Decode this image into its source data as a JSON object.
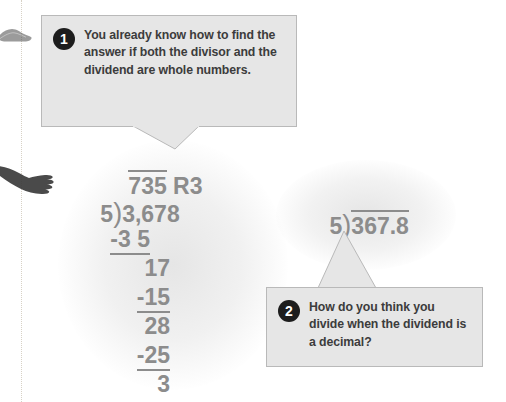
{
  "page": {
    "width": 506,
    "height": 402,
    "background_color": "#ffffff",
    "text_color_callout": "#3c3c3c",
    "text_color_math": "#8c8c8c",
    "callout_fill": "#e6e6e6",
    "callout_border": "#b9b9b9",
    "badge_color": "#1d1d1d",
    "margin_rule_color": "#d8d2c6"
  },
  "callouts": [
    {
      "number": "1",
      "text": "You already know how to find the answer if both the divisor and the dividend are whole numbers."
    },
    {
      "number": "2",
      "text": "How do you think you divide when the dividend is a decimal?"
    }
  ],
  "long_division": {
    "quotient": "735",
    "remainder_label": "R3",
    "divisor": "5",
    "dividend": "3,678",
    "steps": [
      "-3 5",
      "17",
      "-15",
      "28",
      "-25",
      "3"
    ]
  },
  "second_expression": {
    "divisor": "5",
    "dividend": "367.8"
  },
  "decorations": {
    "margin_rule": "dotted-vertical-rule",
    "shoe": "shoe-silhouette",
    "hand": "hand-silhouette"
  }
}
